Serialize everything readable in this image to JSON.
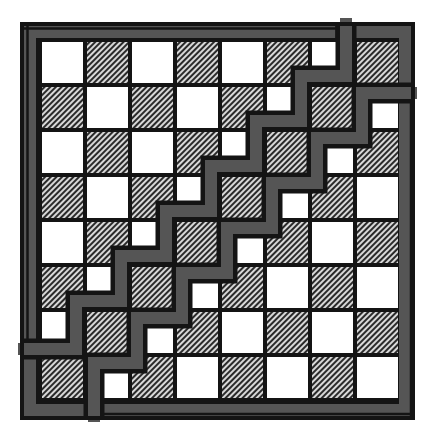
{
  "diagram": {
    "grid": {
      "rows": 8,
      "cols": 8,
      "origin_x": 42,
      "origin_y": 42,
      "pitch": 45,
      "cell_size": 41
    },
    "colors": {
      "background": "#ffffff",
      "outline": "#141414",
      "band": "#555555",
      "light_square": "#ffffff",
      "dark_square_base": "#8a8a8a",
      "hatch_line": "#2a2a2a",
      "hatch_bg": "#d8d8d8"
    },
    "frame": {
      "outer": {
        "x": 20,
        "y": 22,
        "width": 395,
        "height": 398
      },
      "gray_width": 12
    },
    "squares_pattern": "top-left light, alternating",
    "bands": {
      "upper": {
        "width_gray": 12,
        "width_outline": 21,
        "points": [
          [
            346,
            24
          ],
          [
            346,
            76
          ],
          [
            301,
            76
          ],
          [
            301,
            121
          ],
          [
            256,
            121
          ],
          [
            256,
            166
          ],
          [
            211,
            166
          ],
          [
            211,
            211
          ],
          [
            166,
            211
          ],
          [
            166,
            256
          ],
          [
            121,
            256
          ],
          [
            121,
            301
          ],
          [
            76,
            301
          ],
          [
            76,
            349
          ],
          [
            24,
            349
          ]
        ]
      },
      "lower": {
        "width_gray": 12,
        "width_outline": 21,
        "points": [
          [
            411,
            93
          ],
          [
            362,
            93
          ],
          [
            362,
            138
          ],
          [
            317,
            138
          ],
          [
            317,
            183
          ],
          [
            272,
            183
          ],
          [
            272,
            228
          ],
          [
            227,
            228
          ],
          [
            227,
            273
          ],
          [
            182,
            273
          ],
          [
            182,
            318
          ],
          [
            137,
            318
          ],
          [
            137,
            363
          ],
          [
            94,
            363
          ],
          [
            94,
            416
          ]
        ]
      }
    },
    "piece_split_lines": [
      {
        "x1": 22,
        "y1": 28.5,
        "x2": 337,
        "y2": 28.5
      },
      {
        "x1": 336.5,
        "y1": 22,
        "x2": 336.5,
        "y2": 40
      },
      {
        "x1": 27.5,
        "y1": 22,
        "x2": 27.5,
        "y2": 340
      },
      {
        "x1": 100,
        "y1": 414,
        "x2": 415,
        "y2": 414
      },
      {
        "x1": 411,
        "y1": 101,
        "x2": 411,
        "y2": 420
      }
    ]
  }
}
